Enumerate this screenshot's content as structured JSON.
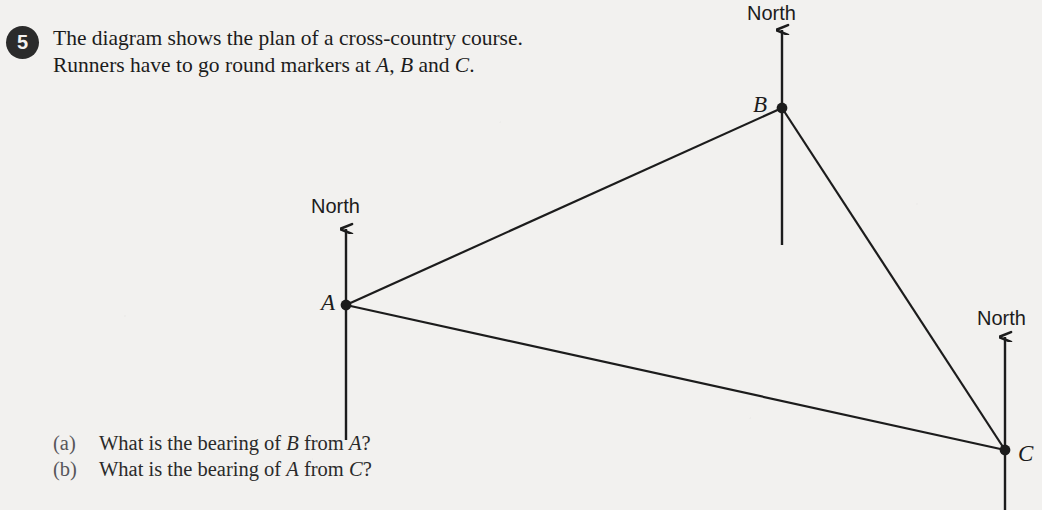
{
  "question": {
    "number": "5",
    "stem_line_1": "The diagram shows the plan of a cross-country course.",
    "stem_line_2_pre": "Runners have to go round markers at ",
    "stem_line_2_a": "A",
    "stem_line_2_mid1": ", ",
    "stem_line_2_b": "B",
    "stem_line_2_mid2": " and ",
    "stem_line_2_c": "C",
    "stem_line_2_end": "."
  },
  "sub_questions": [
    {
      "tag": "(a)",
      "text_pre": "What is the bearing of ",
      "sym1": "B",
      "text_mid": " from ",
      "sym2": "A",
      "text_end": "?"
    },
    {
      "tag": "(b)",
      "text_pre": "What is the bearing of ",
      "sym1": "A",
      "text_mid": " from ",
      "sym2": "C",
      "text_end": "?"
    }
  ],
  "diagram": {
    "type": "bearings-plan",
    "north_label": "North",
    "stroke_color": "#1c1c1c",
    "background_color": "#f2f1ef",
    "markers": [
      {
        "id": "A",
        "label": "A",
        "x": 346,
        "y": 305,
        "label_x": 321,
        "label_y": 290,
        "north_label_x": 311,
        "north_label_y": 195,
        "north_arrow_tip_y": 229,
        "north_line_bottom_y": 440
      },
      {
        "id": "B",
        "label": "B",
        "x": 782,
        "y": 108,
        "label_x": 753,
        "label_y": 92,
        "north_label_x": 747,
        "north_label_y": 2,
        "north_arrow_tip_y": 30,
        "north_line_bottom_y": 245
      },
      {
        "id": "C",
        "label": "C",
        "x": 1005,
        "y": 450,
        "label_x": 1018,
        "label_y": 441,
        "north_label_x": 977,
        "north_label_y": 307,
        "north_arrow_tip_y": 337,
        "north_line_bottom_y": 510
      }
    ],
    "course_legs": [
      {
        "from": "A",
        "to": "B"
      },
      {
        "from": "B",
        "to": "C"
      },
      {
        "from": "A",
        "to": "C"
      }
    ]
  }
}
